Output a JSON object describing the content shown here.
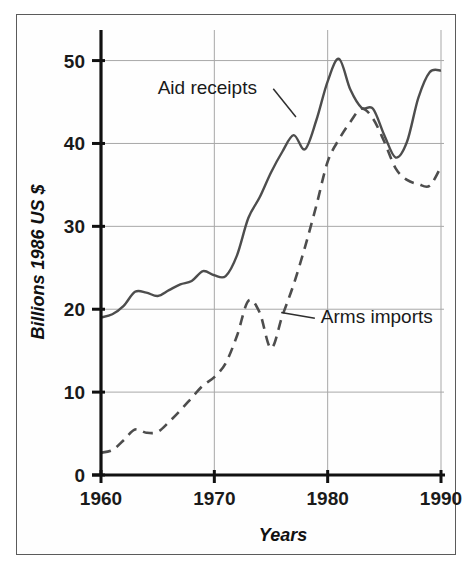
{
  "figure": {
    "border_color": "#5b5b5b",
    "background": "#ffffff"
  },
  "chart_data": {
    "type": "line",
    "title": "",
    "subtitle": "",
    "xlabel": "Years",
    "ylabel": "Billions 1986 US $",
    "xlim": [
      1960,
      1990
    ],
    "ylim": [
      0,
      52
    ],
    "xticks": [
      1960,
      1970,
      1980,
      1990
    ],
    "xtick_labels": [
      "1960",
      "1970",
      "1980",
      "1990"
    ],
    "yticks": [
      0,
      10,
      20,
      30,
      40,
      50
    ],
    "ytick_labels": [
      "0",
      "10",
      "20",
      "30",
      "40",
      "50"
    ],
    "grid": true,
    "grid_color": "#a8a8a8",
    "legend_position": "inline-annotations",
    "annotations": [
      {
        "name": "aid-receipts-annotation",
        "text": "Aid receipts",
        "x": 1965.0,
        "y": 46.0,
        "leader_to_x": 1977.2,
        "leader_to_y": 43.2
      },
      {
        "name": "arms-imports-annotation",
        "text": "Arms imports",
        "x": 1979.4,
        "y": 18.3,
        "leader_to_x": 1975.9,
        "leader_to_y": 19.6
      }
    ],
    "x": [
      1960,
      1961,
      1962,
      1963,
      1964,
      1965,
      1966,
      1967,
      1968,
      1969,
      1970,
      1971,
      1972,
      1973,
      1974,
      1975,
      1976,
      1977,
      1978,
      1979,
      1980,
      1981,
      1982,
      1983,
      1984,
      1985,
      1986,
      1987,
      1988,
      1989,
      1990
    ],
    "series": [
      {
        "name": "Aid receipts",
        "style": "solid",
        "color": "#4d4d4d",
        "values": [
          19.0,
          19.4,
          20.4,
          22.1,
          22.0,
          21.6,
          22.3,
          23.0,
          23.4,
          24.6,
          24.1,
          24.0,
          26.5,
          31.0,
          33.5,
          36.5,
          39.0,
          41.0,
          39.3,
          42.8,
          47.5,
          50.2,
          46.5,
          44.3,
          44.2,
          41.0,
          38.3,
          40.2,
          45.5,
          48.6,
          48.8
        ]
      },
      {
        "name": "Arms imports",
        "style": "dashed",
        "color": "#4d4d4d",
        "values": [
          2.7,
          3.0,
          4.2,
          5.5,
          5.1,
          5.2,
          6.4,
          7.8,
          9.3,
          10.8,
          11.8,
          13.5,
          16.8,
          21.0,
          19.6,
          15.3,
          19.2,
          23.0,
          27.5,
          32.5,
          37.8,
          40.5,
          42.6,
          44.2,
          43.0,
          40.2,
          37.0,
          35.6,
          35.1,
          34.9,
          37.2
        ]
      }
    ]
  }
}
